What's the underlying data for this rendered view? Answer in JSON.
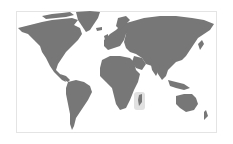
{
  "map": {
    "type": "world-map",
    "land_color": "#777777",
    "water_color": "#ffffff",
    "frame_border_color": "#e4e4e4",
    "highlight": {
      "region": "Madagascar / southeastern Africa",
      "color": "#d9d9d9"
    }
  }
}
